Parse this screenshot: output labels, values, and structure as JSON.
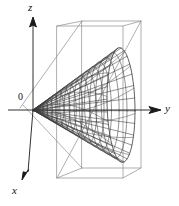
{
  "figure": {
    "kind": "3d-surface-plot",
    "background_color": "#ffffff",
    "ink_color": "#1a1a1a",
    "box_color": "#8d8d94",
    "mesh_color": "#3a3a3a"
  },
  "axes": {
    "z": {
      "label": "z",
      "label_x": 28,
      "label_y": 2,
      "arrow_tip": [
        33,
        17
      ],
      "line_from": [
        33,
        110
      ],
      "line_to": [
        33,
        24
      ]
    },
    "y": {
      "label": "y",
      "label_x": 165,
      "label_y": 103,
      "arrow_tip": [
        161,
        110
      ],
      "line_from": [
        8,
        110
      ],
      "line_to": [
        152,
        110
      ]
    },
    "x": {
      "label": "x",
      "label_x": 12,
      "label_y": 185,
      "arrow_tip": [
        22,
        180
      ],
      "line_from": [
        33,
        110
      ],
      "line_to": [
        28,
        172
      ]
    },
    "origin": {
      "label": "0",
      "label_x": 18,
      "label_y": 92,
      "point": [
        33,
        110
      ]
    }
  },
  "bounding_box": {
    "front_top_left": [
      57,
      26
    ],
    "front_top_right": [
      123,
      26
    ],
    "front_bottom_left": [
      57,
      178
    ],
    "front_bottom_right": [
      123,
      178
    ],
    "back_top_left": [
      82,
      21
    ],
    "back_top_right": [
      141,
      21
    ],
    "back_bottom_left": [
      82,
      168
    ],
    "back_bottom_right": [
      141,
      168
    ]
  },
  "chart_data": {
    "type": "line",
    "title": "",
    "xlabel": "x",
    "ylabel": "y",
    "zlabel": "z",
    "surface": {
      "name": "cone",
      "apex": [
        0,
        0,
        0
      ],
      "axis": "y",
      "opening_direction": "+y",
      "radial_profile": "linear",
      "u_samples": 17,
      "v_samples": 13,
      "y_extent": [
        0,
        1
      ],
      "radius_at_max_y": 1.0
    },
    "legend": [],
    "grid": false
  }
}
